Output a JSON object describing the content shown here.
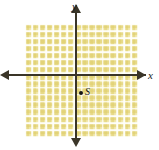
{
  "figure": {
    "type": "coordinate-plane",
    "background_color": "#ffffff",
    "axis_color": "#3a3528",
    "grid_fill_color": "#f2eab2",
    "grid_line_color": "#fffffc",
    "grid_band_color": "#dfcd69",
    "point_color": "#141414"
  },
  "axes": {
    "x_label": "x",
    "y_label": "y",
    "x_arrow_left": "arrow-left",
    "x_arrow_right": "arrow-right",
    "y_arrow_up": "arrow-up",
    "y_arrow_down": "arrow-down"
  },
  "grid": {
    "columns": 16,
    "rows": 16,
    "cell_size_px": 7.07
  },
  "chart_data": {
    "type": "scatter",
    "title": "",
    "xlabel": "x",
    "ylabel": "y",
    "xlim": [
      -7,
      9
    ],
    "ylim": [
      -9,
      7
    ],
    "grid": true,
    "legend": "none",
    "series": [
      {
        "name": "plotted points",
        "points": [
          {
            "label": "S",
            "x": 1,
            "y": -3
          }
        ]
      }
    ]
  },
  "points": [
    {
      "label": "S"
    }
  ]
}
